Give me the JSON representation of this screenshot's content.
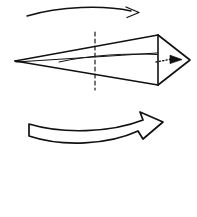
{
  "figure": {
    "title": "Precession diagram of a spinning cone",
    "type": "line-diagram",
    "canvas": {
      "width": 197,
      "height": 217,
      "background_color": "#ffffff"
    },
    "ink_color": "#111111",
    "elements": [
      {
        "name": "precession-arrow",
        "label": "thin curved arrow",
        "description": "Thin curved arrow arcing left to right above the cone, open V arrowhead at right end",
        "direction": "left-to-right",
        "style": "thin-curve-open-head",
        "stroke_width": 1.3
      },
      {
        "name": "cone-body",
        "label": "cone outline",
        "description": "Elongated cone drawn in perspective, apex at left, circular base at right seen edge-on",
        "apex": [
          15,
          61
        ],
        "base_top": [
          158,
          35
        ],
        "base_bottom": [
          158,
          85
        ],
        "style": "outline",
        "stroke_width": 1.6
      },
      {
        "name": "cone-tip",
        "label": "right tip",
        "description": "Open V tip extending right of the base, forming the far point of the cone",
        "point": [
          190,
          60
        ],
        "style": "outline",
        "stroke_width": 1.6
      },
      {
        "name": "symmetry-axis-dashed",
        "label": "dashed symmetry line",
        "description": "Vertical dashed line through the middle of the cone",
        "x": 95,
        "y_top": 32,
        "y_bottom": 90,
        "style": "dashed",
        "stroke_width": 1.1
      },
      {
        "name": "spin-axis-curve",
        "label": "curved interior axis",
        "description": "Gently curved line running inside the cone from near apex to the base",
        "style": "thin-curve",
        "stroke_width": 1.0
      },
      {
        "name": "spin-axis-dotted-arrow",
        "label": "dotted axis arrow",
        "description": "Short dotted line with a solid filled triangular arrowhead pointing right, along the cone axis",
        "style": "dotted-solid-head",
        "stroke_width": 1.1
      },
      {
        "name": "rotation-block-arrow",
        "label": "hollow curved block arrow",
        "description": "Large outlined curved block arrow below the cone pointing right with a barbed arrowhead",
        "direction": "left-to-right",
        "style": "outline-block",
        "stroke_width": 1.6
      }
    ]
  }
}
